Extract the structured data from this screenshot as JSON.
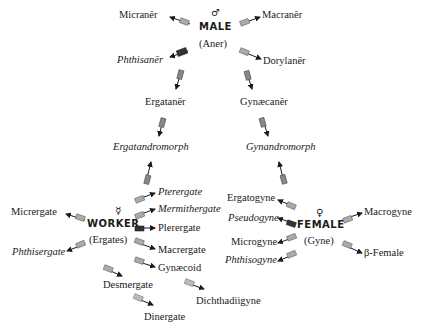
{
  "male": {
    "symbol": "♂",
    "title": "MALE",
    "subtitle": "(Aner)",
    "forms": {
      "micraner": "Micranēr",
      "macraner": "Macranēr",
      "phthisaner": "Phthisanēr",
      "dorylaner": "Dorylanēr",
      "ergataner": "Ergatanēr",
      "gynaecaner": "Gynæcanēr"
    }
  },
  "intermediates": {
    "ergatandromorph": "Ergatandromorph",
    "gynandromorph": "Gynandromorph"
  },
  "worker": {
    "symbol": "☿",
    "title": "WORKER",
    "subtitle": "(Ergates)",
    "forms": {
      "micrergate": "Micrergate",
      "phthisergate": "Phthisergate",
      "pterergate": "Pterergate",
      "mermithergate": "Mermithergate",
      "plerergate": "Plerergate",
      "macrergate": "Macrergate",
      "gynaecoid": "Gynæcoid",
      "desmergate": "Desmergate",
      "dinergate": "Dinergate",
      "dichthadiigyne": "Dichthadiigyne"
    }
  },
  "female": {
    "symbol": "♀",
    "title": "FEMALE",
    "subtitle": "(Gyne)",
    "forms": {
      "ergatogyne": "Ergatogyne",
      "pseudogyne": "Pseudogyne",
      "microgyne": "Microgyne",
      "phthisogyne": "Phthisogyne",
      "macrogyne": "Macrogyne",
      "beta_female": "β-Female"
    }
  },
  "colors": {
    "ink": "#1a1a1a",
    "arrow_light": "#9a9a9a",
    "arrow_dark": "#2a2a2a"
  }
}
